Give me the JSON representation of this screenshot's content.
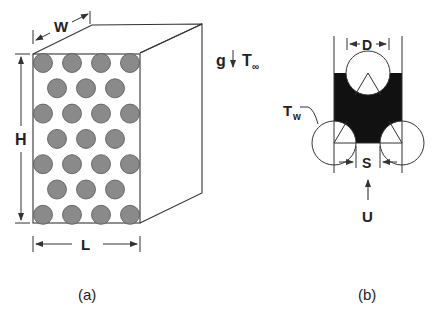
{
  "figure_a": {
    "caption": "(a)",
    "dim_width": "W",
    "dim_height": "H",
    "dim_length": "L",
    "gravity_label": "g",
    "ambient_temp_label": "T",
    "ambient_temp_sub": "∞",
    "rod_rows": 7,
    "rod_pattern": "staggered"
  },
  "figure_b": {
    "caption": "(b)",
    "diameter_label": "D",
    "spacing_label": "S",
    "wall_temp_label": "T",
    "wall_temp_sub": "w",
    "flow_label": "U"
  },
  "colors": {
    "line": "#333333",
    "rod_fill": "#8a8a8a",
    "fluid_fill": "#111111",
    "background": "#ffffff"
  }
}
